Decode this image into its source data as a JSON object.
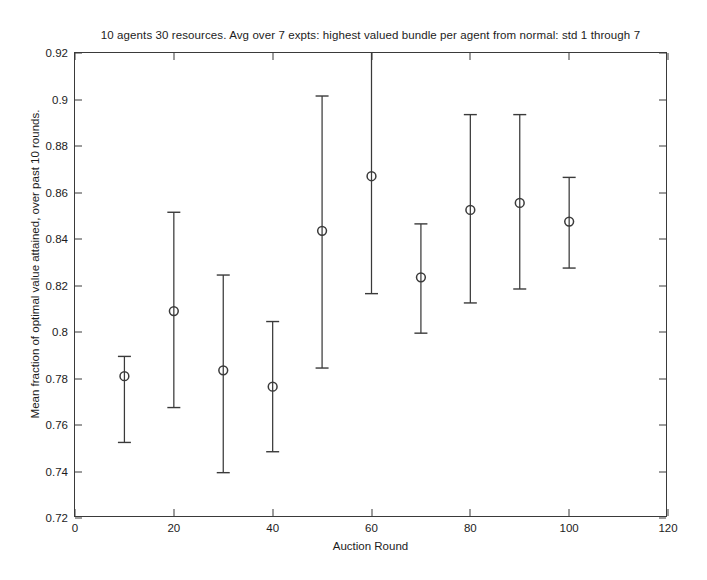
{
  "chart_data": {
    "type": "scatter",
    "title": "10 agents 30 resources. Avg over 7 expts: highest valued bundle per agent from normal: std 1 through 7",
    "xlabel": "Auction Round",
    "ylabel": "Mean fraction of optimal value attained, over past 10 rounds.",
    "xlim": [
      0,
      120
    ],
    "ylim": [
      0.72,
      0.92
    ],
    "xticks": [
      0,
      20,
      40,
      60,
      80,
      100,
      120
    ],
    "yticks": [
      0.72,
      0.74,
      0.76,
      0.78,
      0.8,
      0.82,
      0.84,
      0.86,
      0.88,
      0.9,
      0.92
    ],
    "xticklabels": [
      "0",
      "20",
      "40",
      "60",
      "80",
      "100",
      "120"
    ],
    "yticklabels": [
      "0.72",
      "0.74",
      "0.76",
      "0.78",
      "0.8",
      "0.82",
      "0.84",
      "0.86",
      "0.88",
      "0.9",
      "0.92"
    ],
    "grid": false,
    "legend": null,
    "marker": "open-circle",
    "errorbar_style": "vertical-with-caps",
    "line_color": "#3a3a3a",
    "x": [
      10,
      20,
      30,
      40,
      50,
      60,
      70,
      80,
      90,
      100
    ],
    "values": [
      0.781,
      0.809,
      0.7835,
      0.7765,
      0.8435,
      0.867,
      0.8235,
      0.8525,
      0.8555,
      0.8475
    ],
    "err_low": [
      0.7525,
      0.7675,
      0.7395,
      0.7485,
      0.7845,
      0.8165,
      0.7995,
      0.8125,
      0.8185,
      0.8275
    ],
    "err_high": [
      0.7895,
      0.8515,
      0.8245,
      0.8045,
      0.9015,
      0.9255,
      0.8465,
      0.8935,
      0.8935,
      0.8665
    ]
  }
}
